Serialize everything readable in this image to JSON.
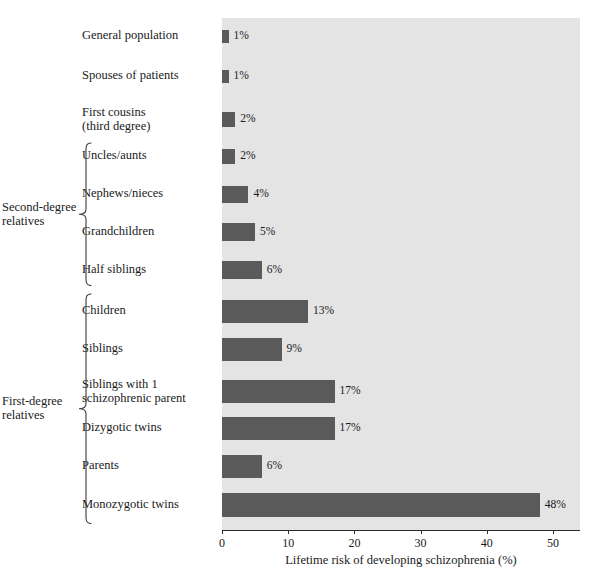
{
  "chart_data": {
    "type": "bar",
    "orientation": "horizontal",
    "title": "",
    "subtitle": "",
    "xlabel": "Lifetime risk of developing schizophrenia (%)",
    "ylabel": "",
    "xlim": [
      0,
      54
    ],
    "xticks": [
      0,
      10,
      20,
      30,
      40,
      50
    ],
    "xticklabels": [
      "0",
      "10",
      "20",
      "30",
      "40",
      "50"
    ],
    "grid": false,
    "legend": null,
    "bar_color": "#5a5a5a",
    "plot_background": "#e4e4e4",
    "categories": [
      "General population",
      "Spouses of patients",
      "First cousins\n(third degree)",
      "Uncles/aunts",
      "Nephews/nieces",
      "Grandchildren",
      "Half siblings",
      "Children",
      "Siblings",
      "Siblings with 1\nschizophrenic parent",
      "Dizygotic twins",
      "Parents",
      "Monozygotic twins"
    ],
    "values": [
      1,
      1,
      2,
      2,
      4,
      5,
      6,
      13,
      9,
      17,
      17,
      6,
      48
    ],
    "data_labels": [
      "1%",
      "1%",
      "2%",
      "2%",
      "4%",
      "5%",
      "6%",
      "13%",
      "9%",
      "17%",
      "17%",
      "6%",
      "48%"
    ]
  },
  "groups": [
    {
      "label": "Second-degree\nrelatives",
      "first_index": 3,
      "last_index": 6
    },
    {
      "label": "First-degree\nrelatives",
      "first_index": 7,
      "last_index": 12
    }
  ]
}
